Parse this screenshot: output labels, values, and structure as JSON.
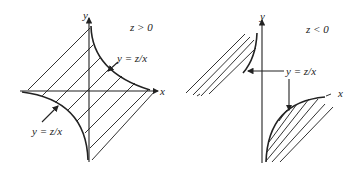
{
  "figure": {
    "left_panel": {
      "condition": "z > 0",
      "x_axis_label": "x",
      "y_axis_label": "y",
      "curve_label_upper": "y = z/x",
      "curve_label_lower": "y = z/x"
    },
    "right_panel": {
      "condition": "z < 0",
      "x_axis_label": "x",
      "y_axis_label": "y",
      "curve_label": "y = z/x"
    }
  },
  "colors": {
    "ink": "#222222",
    "background": "#ffffff"
  }
}
